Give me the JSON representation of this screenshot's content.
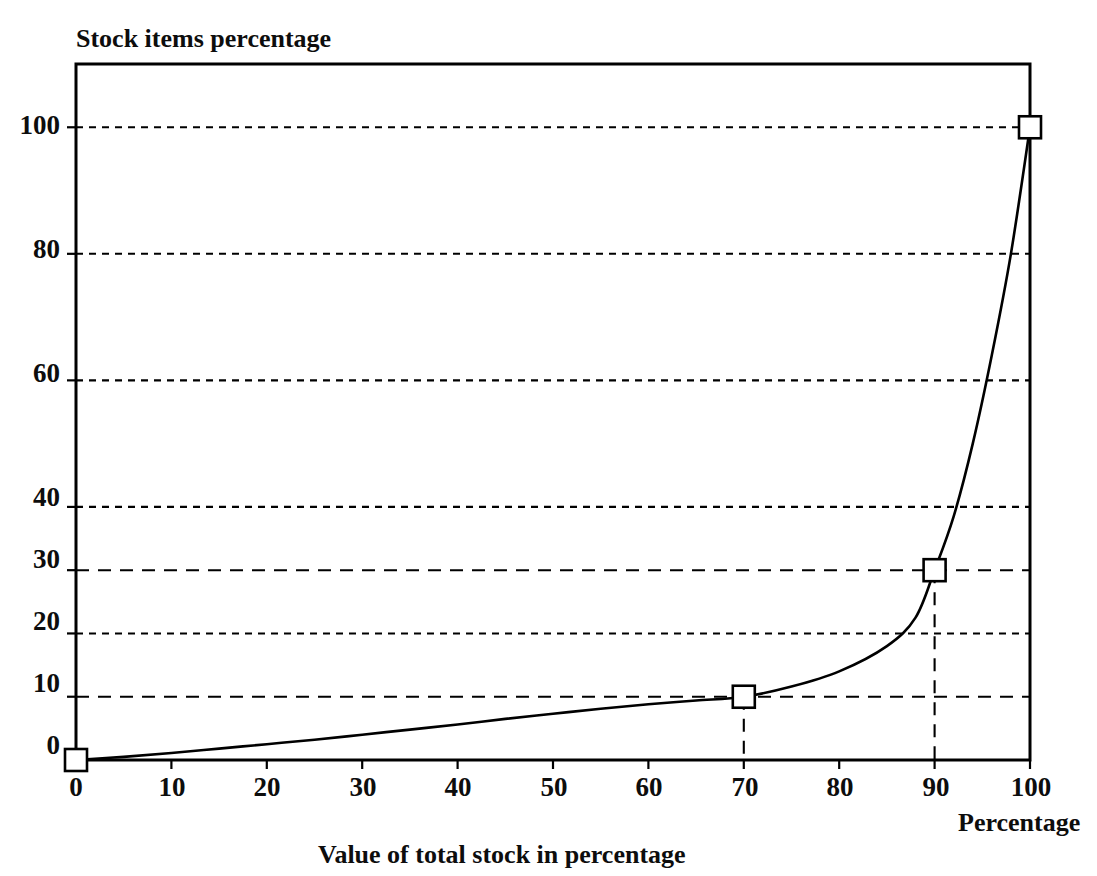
{
  "chart_data": {
    "type": "line",
    "title": "",
    "ylabel": "Stock items percentage",
    "xlabel": "Value of total stock in percentage",
    "x_axis_right_label": "Percentage",
    "xlim": [
      0,
      100
    ],
    "ylim": [
      0,
      110
    ],
    "grid": true,
    "grid_position": "horizontal",
    "legend": "none",
    "xticks": [
      0,
      10,
      20,
      30,
      40,
      50,
      60,
      70,
      80,
      90,
      100
    ],
    "xtick_labels": [
      "0",
      "10",
      "20",
      "30",
      "40",
      "50",
      "60",
      "70",
      "80",
      "90",
      "100"
    ],
    "yticks": [
      0,
      10,
      20,
      30,
      40,
      60,
      80,
      100
    ],
    "ytick_labels": [
      "0",
      "10",
      "20",
      "30",
      "40",
      "60",
      "80",
      "100"
    ],
    "gridlines": [
      {
        "value": 100,
        "style": "dotted"
      },
      {
        "value": 80,
        "style": "dotted"
      },
      {
        "value": 60,
        "style": "dotted"
      },
      {
        "value": 40,
        "style": "dotted"
      },
      {
        "value": 30,
        "style": "dashed"
      },
      {
        "value": 20,
        "style": "dotted"
      },
      {
        "value": 10,
        "style": "dashed"
      }
    ],
    "drop_lines_x": [
      70,
      90
    ],
    "series": [
      {
        "name": "Cumulative stock items vs value (Pareto / ABC curve)",
        "style": "solid",
        "marker": "open-square",
        "x": [
          0,
          5,
          10,
          15,
          20,
          25,
          30,
          35,
          40,
          45,
          50,
          55,
          60,
          65,
          70,
          75,
          80,
          85,
          88,
          90,
          92,
          94,
          96,
          98,
          100
        ],
        "y": [
          0,
          0.5,
          1.1,
          1.8,
          2.5,
          3.2,
          4.0,
          4.8,
          5.6,
          6.5,
          7.3,
          8.1,
          8.8,
          9.4,
          10.0,
          11.6,
          14.0,
          18.0,
          22.5,
          30.0,
          38.5,
          50.0,
          64.0,
          80.0,
          100.0
        ]
      }
    ],
    "marked_points": [
      {
        "x": 0,
        "y": 0,
        "label": ""
      },
      {
        "x": 70,
        "y": 10,
        "label": ""
      },
      {
        "x": 90,
        "y": 30,
        "label": ""
      },
      {
        "x": 100,
        "y": 100,
        "label": ""
      }
    ],
    "colors": {
      "line": "#000000",
      "grid": "#000000",
      "frame": "#000000",
      "marker_fill": "#ffffff"
    }
  },
  "axes": {
    "y_title": "Stock items percentage",
    "x_title": "Value of total stock in percentage",
    "x_right_title": "Percentage"
  },
  "ytick_labels": [
    "100",
    "80",
    "60",
    "40",
    "30",
    "20",
    "10",
    "0"
  ],
  "xtick_labels": [
    "0",
    "10",
    "20",
    "30",
    "40",
    "50",
    "60",
    "70",
    "80",
    "90",
    "100"
  ]
}
